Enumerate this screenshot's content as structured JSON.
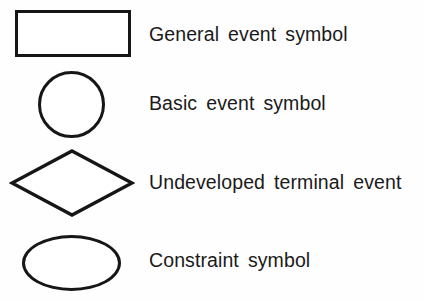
{
  "legend": {
    "background_color": "#fefefe",
    "stroke_color": "#161616",
    "text_color": "#1a1a1a",
    "rows": [
      {
        "shape": "rectangle",
        "shape_icon_name": "rectangle-shape-icon",
        "label": "General event symbol"
      },
      {
        "shape": "circle",
        "shape_icon_name": "circle-shape-icon",
        "label": "Basic event symbol"
      },
      {
        "shape": "diamond",
        "shape_icon_name": "diamond-shape-icon",
        "label": "Undeveloped terminal event"
      },
      {
        "shape": "ellipse",
        "shape_icon_name": "ellipse-shape-icon",
        "label": "Constraint symbol"
      }
    ]
  }
}
